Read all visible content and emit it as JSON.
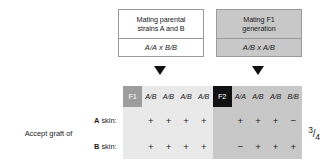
{
  "figure": {
    "type": "genetics-skin-graft-table",
    "boxes": [
      {
        "id": "parental",
        "title": "Mating parental\nstrains A and B",
        "cross": "A/A x B/B",
        "background": "#ffffff"
      },
      {
        "id": "f1",
        "title": "Mating F1\ngeneration",
        "cross": "A/B x A/B",
        "background": "#c8c8c8"
      }
    ],
    "arrows": [
      "down-arrow-parental",
      "down-arrow-f1"
    ],
    "table": {
      "row_label": "Accept graft of",
      "row_headers": [
        "A skin:",
        "B skin:"
      ],
      "groups": [
        {
          "tag": "F1",
          "tag_background": "#9d9d9d",
          "cell_background": "#e9e9e9",
          "genotypes": [
            "A/B",
            "A/B",
            "A/B",
            "A/B"
          ],
          "rows": [
            {
              "label": "A skin:",
              "values": [
                "+",
                "+",
                "+",
                "+"
              ]
            },
            {
              "label": "B skin:",
              "values": [
                "+",
                "+",
                "+",
                "+"
              ]
            }
          ]
        },
        {
          "tag": "F2",
          "tag_background": "#111111",
          "cell_background": "#c8c8c8",
          "genotypes": [
            "A/A",
            "A/B",
            "A/B",
            "B/B"
          ],
          "rows": [
            {
              "label": "A skin:",
              "values": [
                "+",
                "+",
                "+",
                "−"
              ]
            },
            {
              "label": "B skin:",
              "values": [
                "−",
                "+",
                "+",
                "+"
              ]
            }
          ]
        }
      ],
      "fraction": {
        "numerator": "3",
        "denominator": "4",
        "display": "3/4"
      }
    }
  }
}
